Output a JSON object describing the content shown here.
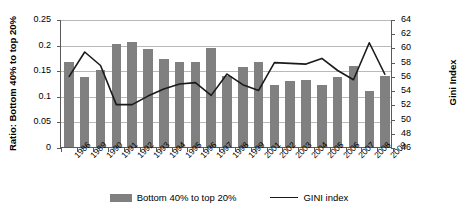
{
  "chart_data": {
    "type": "bar",
    "title": "",
    "xlabel": "",
    "ylabel": "Ratio: Bottom 40% to top 20%",
    "y2label": "Gini Index",
    "ylim": [
      0,
      0.25
    ],
    "y2lim": [
      46,
      64
    ],
    "yticks": [
      "0",
      "0.05",
      "0.1",
      "0.15",
      "0.2",
      "0.25"
    ],
    "ytick_values": [
      0,
      0.05,
      0.1,
      0.15,
      0.2,
      0.25
    ],
    "y2ticks": [
      "46",
      "48",
      "50",
      "52",
      "54",
      "56",
      "58",
      "60",
      "62",
      "64"
    ],
    "y2tick_values": [
      46,
      48,
      50,
      52,
      54,
      56,
      58,
      60,
      62,
      64
    ],
    "grid": true,
    "legend_position": "bottom",
    "categories": [
      "1986",
      "1989",
      "1990",
      "1991",
      "1992",
      "1993",
      "1994",
      "1995",
      "1996",
      "1997",
      "1998",
      "1999",
      "2001",
      "2002",
      "2003",
      "2004",
      "2005",
      "2006",
      "2007",
      "2008",
      "2009"
    ],
    "series": [
      {
        "name": "Bottom 40% to top 20%",
        "type": "bar",
        "axis": "left",
        "color": "#808080",
        "values": [
          0.167,
          0.136,
          0.15,
          0.201,
          0.206,
          0.191,
          0.171,
          0.167,
          0.167,
          0.193,
          0.139,
          0.156,
          0.167,
          0.121,
          0.129,
          0.13,
          0.121,
          0.137,
          0.158,
          0.11,
          0.138
        ]
      },
      {
        "name": "GINI index",
        "type": "line",
        "axis": "right",
        "color": "#1a1a1a",
        "values": [
          56.0,
          59.5,
          57.6,
          52.1,
          52.1,
          53.3,
          54.3,
          55.0,
          55.2,
          53.4,
          56.4,
          54.9,
          54.1,
          58.0,
          57.9,
          57.8,
          58.6,
          56.9,
          55.6,
          60.8,
          56.3
        ]
      }
    ]
  },
  "legend": {
    "items": [
      {
        "label": "Bottom 40% to top 20%",
        "marker": "bar-swatch"
      },
      {
        "label": "GINI index",
        "marker": "line-swatch"
      }
    ]
  }
}
